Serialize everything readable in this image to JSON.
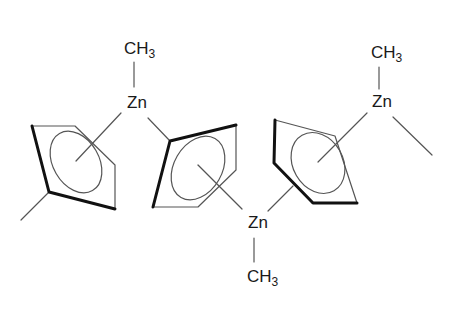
{
  "diagram": {
    "type": "chemical-structure",
    "labels": {
      "zn1": {
        "element": "Zn",
        "methyl": "CH",
        "methyl_sub": "3"
      },
      "zn2": {
        "element": "Zn",
        "methyl": "CH",
        "methyl_sub": "3"
      },
      "zn3": {
        "element": "Zn",
        "methyl": "CH",
        "methyl_sub": "3"
      }
    },
    "rings": [
      {
        "id": "ring-left",
        "count_vertices": 5
      },
      {
        "id": "ring-middle",
        "count_vertices": 5
      },
      {
        "id": "ring-right",
        "count_vertices": 5
      }
    ],
    "colors": {
      "line": "#555555",
      "thick": "#111111",
      "text": "#1a1a1a"
    }
  }
}
